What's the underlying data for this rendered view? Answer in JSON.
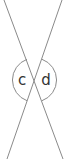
{
  "diagram": {
    "type": "vertical-angles",
    "lines": [
      {
        "name": "line-a",
        "x1": 4,
        "y1": 0,
        "x2": 63,
        "y2": 159
      },
      {
        "name": "line-b",
        "x1": 62,
        "y1": 0,
        "x2": 7,
        "y2": 159
      }
    ],
    "intersection": {
      "x": 34.5,
      "y": 80
    },
    "arc_radius": 22,
    "angle_labels": [
      {
        "label": "c",
        "x": 22,
        "y": 85
      },
      {
        "label": "d",
        "x": 46,
        "y": 85
      }
    ],
    "colors": {
      "line": "#8a8a8a",
      "arc": "#8a8a8a",
      "text": "#333333"
    }
  }
}
